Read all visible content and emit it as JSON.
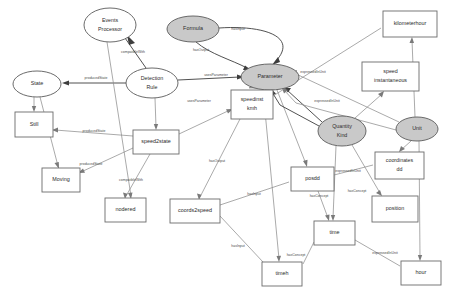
{
  "diagram": {
    "canvas": {
      "width": 455,
      "height": 303,
      "background": "#ffffff"
    },
    "colors": {
      "node_fill_highlight": "#c9c9c9",
      "node_fill_plain": "#ffffff",
      "node_stroke": "#5a5a5a",
      "edge_stroke": "#8e8e8e",
      "edge_stroke_strong": "#3d3d3d",
      "text": "#2b2b2b"
    },
    "legend_note": "Shaded ellipses are class concepts; white rectangles are instances.",
    "nodes": [
      {
        "id": "events_processor",
        "label": "Events Processor",
        "label_line1": "Events",
        "label_line2": "Processor",
        "shape": "ellipse",
        "fill": "plain",
        "cx": 110,
        "cy": 25,
        "rx": 26,
        "ry": 17
      },
      {
        "id": "formula",
        "label": "Formula",
        "label_line1": "Formula",
        "label_line2": "",
        "shape": "ellipse",
        "fill": "highlight",
        "cx": 193,
        "cy": 29,
        "rx": 26,
        "ry": 13
      },
      {
        "id": "state",
        "label": "State",
        "label_line1": "State",
        "label_line2": "",
        "shape": "ellipse",
        "fill": "plain",
        "cx": 37,
        "cy": 84,
        "rx": 24,
        "ry": 13
      },
      {
        "id": "detection_rule",
        "label": "Detection Rule",
        "label_line1": "Detection",
        "label_line2": "Rule",
        "shape": "ellipse",
        "fill": "plain",
        "cx": 152,
        "cy": 83,
        "rx": 26,
        "ry": 15
      },
      {
        "id": "parameter",
        "label": "Parameter",
        "label_line1": "Parameter",
        "label_line2": "",
        "shape": "ellipse",
        "fill": "highlight",
        "cx": 270,
        "cy": 77,
        "rx": 29,
        "ry": 13
      },
      {
        "id": "quantity_kind",
        "label": "Quantity Kind",
        "label_line1": "Quantity",
        "label_line2": "Kind",
        "shape": "ellipse",
        "fill": "highlight",
        "cx": 342,
        "cy": 131,
        "rx": 24,
        "ry": 15
      },
      {
        "id": "unit",
        "label": "Unit",
        "label_line1": "Unit",
        "label_line2": "",
        "shape": "ellipse",
        "fill": "highlight",
        "cx": 417,
        "cy": 129,
        "rx": 21,
        "ry": 12
      },
      {
        "id": "still",
        "label": "Still",
        "label_line1": "Still",
        "label_line2": "",
        "shape": "rect",
        "x": 15,
        "y": 112,
        "w": 38,
        "h": 25
      },
      {
        "id": "moving",
        "label": "Moving",
        "label_line1": "Moving",
        "label_line2": "",
        "shape": "rect",
        "x": 42,
        "y": 168,
        "w": 38,
        "h": 24
      },
      {
        "id": "speed2state",
        "label": "speed2state",
        "label_line1": "speed2state",
        "label_line2": "",
        "shape": "rect",
        "x": 133,
        "y": 130,
        "w": 46,
        "h": 24
      },
      {
        "id": "nodered",
        "label": "nodered",
        "label_line1": "nodered",
        "label_line2": "",
        "shape": "rect",
        "x": 105,
        "y": 198,
        "w": 41,
        "h": 24
      },
      {
        "id": "coords2speed",
        "label": "coords2speed",
        "label_line1": "coords2speed",
        "label_line2": "",
        "shape": "rect",
        "x": 170,
        "y": 199,
        "w": 50,
        "h": 24
      },
      {
        "id": "timeh",
        "label": "timeh",
        "label_line1": "timeh",
        "label_line2": "",
        "shape": "rect",
        "x": 262,
        "y": 262,
        "w": 40,
        "h": 24
      },
      {
        "id": "speedinst_kmh",
        "label": "speedinst kmh",
        "label_line1": "speedinst",
        "label_line2": "kmh",
        "shape": "rect",
        "x": 231,
        "y": 90,
        "w": 42,
        "h": 29
      },
      {
        "id": "posdd",
        "label": "posdd",
        "label_line1": "posdd",
        "label_line2": "",
        "shape": "rect",
        "x": 291,
        "y": 167,
        "w": 43,
        "h": 24
      },
      {
        "id": "time",
        "label": "time",
        "label_line1": "time",
        "label_line2": "",
        "shape": "rect",
        "x": 314,
        "y": 221,
        "w": 41,
        "h": 24
      },
      {
        "id": "hour",
        "label": "hour",
        "label_line1": "hour",
        "label_line2": "",
        "shape": "rect",
        "x": 401,
        "y": 261,
        "w": 40,
        "h": 24
      },
      {
        "id": "kilometerhour",
        "label": "kilometerhour",
        "label_line1": "kilometerhour",
        "label_line2": "",
        "shape": "rect",
        "x": 383,
        "y": 11,
        "w": 54,
        "h": 26
      },
      {
        "id": "speed_instantaneous",
        "label": "speed instantaneous",
        "label_line1": "speed",
        "label_line2": "instantaneous",
        "shape": "rect",
        "x": 362,
        "y": 62,
        "w": 57,
        "h": 29
      },
      {
        "id": "coordinates_dd",
        "label": "coordinates dd",
        "label_line1": "coordinates",
        "label_line2": "dd",
        "shape": "rect",
        "x": 375,
        "y": 152,
        "w": 49,
        "h": 27
      },
      {
        "id": "position",
        "label": "position",
        "label_line1": "position",
        "label_line2": "",
        "shape": "rect",
        "x": 372,
        "y": 196,
        "w": 46,
        "h": 26
      }
    ],
    "edges": [
      {
        "id": "e1",
        "from": "detection_rule",
        "to": "state",
        "label": "producedState",
        "lx": 96,
        "ly": 78,
        "strong": true
      },
      {
        "id": "e2",
        "from": "events_processor",
        "to": "detection_rule",
        "label": "compatibleWith",
        "lx": 133,
        "ly": 52,
        "strong": true
      },
      {
        "id": "e3",
        "from": "detection_rule",
        "to": "parameter",
        "label": "usesParameter",
        "lx": 216,
        "ly": 75,
        "strong": true
      },
      {
        "id": "e4",
        "from": "formula",
        "to": "parameter",
        "label": "hasInput",
        "lx": 236,
        "ly": 30,
        "strong": true
      },
      {
        "id": "e5",
        "from": "formula",
        "to": "parameter",
        "label": "hasOutput",
        "lx": 200,
        "ly": 48,
        "strong": true
      },
      {
        "id": "e6",
        "from": "state",
        "to": "still",
        "label": "",
        "lx": 0,
        "ly": 0,
        "strong": false
      },
      {
        "id": "e7",
        "from": "state",
        "to": "moving",
        "label": "",
        "lx": 0,
        "ly": 0,
        "strong": false
      },
      {
        "id": "e8",
        "from": "speed2state",
        "to": "still",
        "label": "producedState",
        "lx": 94,
        "ly": 131,
        "strong": false
      },
      {
        "id": "e9",
        "from": "speed2state",
        "to": "moving",
        "label": "producedState",
        "lx": 90,
        "ly": 163,
        "strong": false
      },
      {
        "id": "e10",
        "from": "detection_rule",
        "to": "speed2state",
        "label": "",
        "lx": 0,
        "ly": 0,
        "strong": false
      },
      {
        "id": "e11",
        "from": "speed2state",
        "to": "nodered",
        "label": "compatibleWith",
        "lx": 131,
        "ly": 180,
        "strong": false
      },
      {
        "id": "e12",
        "from": "events_processor",
        "to": "nodered",
        "label": "",
        "lx": 0,
        "ly": 0,
        "strong": false
      },
      {
        "id": "e13",
        "from": "speed2state",
        "to": "speedinst_kmh",
        "label": "usesParameter",
        "lx": 199,
        "ly": 100,
        "strong": false
      },
      {
        "id": "e14",
        "from": "parameter",
        "to": "speedinst_kmh",
        "label": "",
        "lx": 0,
        "ly": 0,
        "strong": false
      },
      {
        "id": "e15",
        "from": "speedinst_kmh",
        "to": "coords2speed",
        "label": "hasOutput",
        "lx": 216,
        "ly": 160,
        "strong": false
      },
      {
        "id": "e16",
        "from": "coords2speed",
        "to": "posdd",
        "label": "hasInput",
        "lx": 256,
        "ly": 196,
        "strong": false
      },
      {
        "id": "e17",
        "from": "coords2speed",
        "to": "timeh",
        "label": "hasInput",
        "lx": 240,
        "ly": 245,
        "strong": false
      },
      {
        "id": "e18",
        "from": "parameter",
        "to": "posdd",
        "label": "",
        "lx": 0,
        "ly": 0,
        "strong": false
      },
      {
        "id": "e19",
        "from": "parameter",
        "to": "timeh",
        "label": "",
        "lx": 0,
        "ly": 0,
        "strong": false
      },
      {
        "id": "e20",
        "from": "quantity_kind",
        "to": "parameter",
        "label": "hasConcept",
        "lx": 252,
        "ly": 95,
        "strong": true
      },
      {
        "id": "e21",
        "from": "quantity_kind",
        "to": "parameter",
        "label": "hasConcept",
        "lx": 247,
        "ly": 103,
        "strong": true
      },
      {
        "id": "e22",
        "from": "unit",
        "to": "parameter",
        "label": "expressedInUnit",
        "lx": 311,
        "ly": 73,
        "strong": false
      },
      {
        "id": "e23",
        "from": "unit",
        "to": "parameter",
        "label": "expressedInUnit",
        "lx": 325,
        "ly": 101,
        "strong": false
      },
      {
        "id": "e24",
        "from": "unit",
        "to": "kilometerhour",
        "label": "",
        "lx": 0,
        "ly": 0,
        "strong": false
      },
      {
        "id": "e25",
        "from": "speedinst_kmh",
        "to": "kilometerhour",
        "label": "",
        "lx": 0,
        "ly": 0,
        "strong": false
      },
      {
        "id": "e26",
        "from": "quantity_kind",
        "to": "speed_instantaneous",
        "label": "",
        "lx": 0,
        "ly": 0,
        "strong": false
      },
      {
        "id": "e27",
        "from": "unit",
        "to": "coordinates_dd",
        "label": "",
        "lx": 0,
        "ly": 0,
        "strong": false
      },
      {
        "id": "e28",
        "from": "posdd",
        "to": "coordinates_dd",
        "label": "expressedInUnit",
        "lx": 346,
        "ly": 172,
        "strong": false
      },
      {
        "id": "e29",
        "from": "quantity_kind",
        "to": "position",
        "label": "hasConcept",
        "lx": 355,
        "ly": 192,
        "strong": false
      },
      {
        "id": "e30",
        "from": "posdd",
        "to": "time",
        "label": "hasConcept",
        "lx": 318,
        "ly": 194,
        "strong": false
      },
      {
        "id": "e31",
        "from": "quantity_kind",
        "to": "time",
        "label": "",
        "lx": 0,
        "ly": 0,
        "strong": false
      },
      {
        "id": "e32",
        "from": "time",
        "to": "timeh",
        "label": "hasConcept",
        "lx": 297,
        "ly": 255,
        "strong": false
      },
      {
        "id": "e33",
        "from": "time",
        "to": "hour",
        "label": "expressedInUnit",
        "lx": 383,
        "ly": 253,
        "strong": false
      },
      {
        "id": "e34",
        "from": "unit",
        "to": "hour",
        "label": "",
        "lx": 0,
        "ly": 0,
        "strong": false
      }
    ],
    "relation_types": [
      "producedState",
      "compatibleWith",
      "usesParameter",
      "hasInput",
      "hasOutput",
      "hasConcept",
      "expressedInUnit"
    ]
  }
}
